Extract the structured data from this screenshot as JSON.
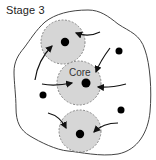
{
  "title": "Stage 3",
  "diagram": {
    "core_label": "Core",
    "colors": {
      "boundary": "#444444",
      "circle_fill": "#d6d6d6",
      "circle_stroke": "#888888",
      "dot": "#000000",
      "arrow": "#111111"
    },
    "circles": [
      {
        "name": "top-circle",
        "cx": 63,
        "cy": 42,
        "r": 22
      },
      {
        "name": "core-circle",
        "cx": 79,
        "cy": 83,
        "r": 22,
        "label": "Core"
      },
      {
        "name": "bottom-circle",
        "cx": 80,
        "cy": 131,
        "r": 21
      }
    ],
    "free_dots": [
      {
        "cx": 119,
        "cy": 51
      },
      {
        "cx": 43,
        "cy": 95
      },
      {
        "cx": 121,
        "cy": 110
      }
    ]
  }
}
